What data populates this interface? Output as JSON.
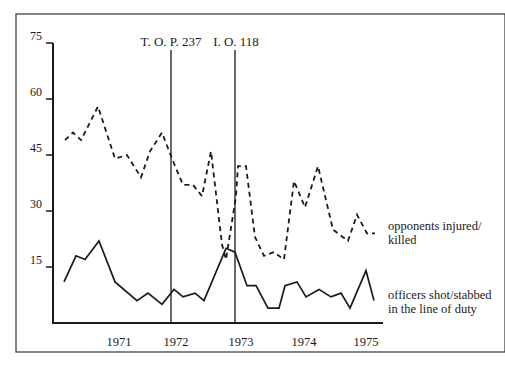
{
  "chart_data": {
    "type": "line",
    "title": "",
    "xlabel": "",
    "ylabel": "",
    "ylim": [
      0,
      75
    ],
    "yticks": [
      75,
      60,
      45,
      30,
      15
    ],
    "xtick_labels": [
      "1971",
      "1972",
      "1973",
      "1974",
      "1975"
    ],
    "grid": false,
    "annotations": [
      {
        "label": "T. O. P. 237",
        "position": "vertical line just before 1972"
      },
      {
        "label": "I. O. 118",
        "position": "vertical line just before 1973"
      }
    ],
    "series": [
      {
        "name": "opponents injured/ killed",
        "style": "dashed",
        "values": [
          49,
          51,
          49,
          58,
          44,
          45,
          39,
          46,
          51,
          44,
          37,
          37,
          34,
          46,
          21,
          17,
          34,
          42,
          42,
          23,
          18,
          19,
          17,
          38,
          31,
          42,
          25,
          22,
          29,
          24,
          24
        ]
      },
      {
        "name": "officers shot/stabbed in the line of duty",
        "style": "solid",
        "values": [
          11,
          18,
          17,
          22,
          11,
          6,
          8,
          5,
          9,
          7,
          8,
          6,
          20,
          19,
          10,
          10,
          4,
          4,
          10,
          11,
          7,
          9,
          7,
          8,
          4,
          14,
          6
        ]
      }
    ]
  },
  "layout": {
    "y_axis": {
      "x": 53,
      "y0": 323,
      "px_per_unit": 3.733
    },
    "dashed_x": [
      65,
      73,
      81,
      98,
      115,
      127,
      141,
      150,
      162,
      172,
      183,
      193,
      202,
      211,
      222,
      226,
      236,
      238,
      246,
      255,
      264,
      274,
      284,
      294,
      305,
      318,
      333,
      348,
      357,
      367,
      375
    ],
    "solid_x": [
      64,
      76,
      85,
      99,
      115,
      137,
      148,
      162,
      174,
      183,
      195,
      204,
      226,
      235,
      247,
      256,
      268,
      279,
      285,
      297,
      306,
      319,
      331,
      341,
      350,
      366,
      374
    ],
    "xtick_x": [
      119,
      176,
      241,
      304,
      366
    ],
    "vlines_x": [
      171,
      235
    ]
  },
  "legend": {
    "opponents_line1": "opponents injured/",
    "opponents_line2": "killed",
    "officers_line1": "officers shot/stabbed",
    "officers_line2": "in the line of duty"
  },
  "annotations": {
    "top237": "T. O. P. 237",
    "io118": "I. O. 118"
  }
}
